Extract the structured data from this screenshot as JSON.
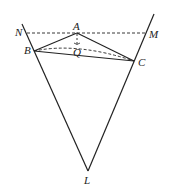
{
  "diagram": {
    "type": "geometry",
    "points": {
      "N": {
        "label": "N",
        "x": 24,
        "y": 33
      },
      "M": {
        "label": "M",
        "x": 146,
        "y": 33
      },
      "A": {
        "label": "A",
        "x": 77,
        "y": 33
      },
      "B": {
        "label": "B",
        "x": 34,
        "y": 51
      },
      "C": {
        "label": "C",
        "x": 134,
        "y": 61
      },
      "Q": {
        "label": "Q",
        "x": 77,
        "y": 52
      },
      "L": {
        "label": "L",
        "x": 88,
        "y": 171
      }
    },
    "labels": {
      "N": "N",
      "M": "M",
      "A": "A",
      "B": "B",
      "C": "C",
      "Q": "Q",
      "L": "L"
    },
    "segments_solid": [
      "NL",
      "ML",
      "AB",
      "AC",
      "BC"
    ],
    "segments_dashed": [
      "NM",
      "AQ",
      "BQ'",
      "QC"
    ],
    "colors": {
      "line": "#222222",
      "background": "#ffffff"
    }
  }
}
